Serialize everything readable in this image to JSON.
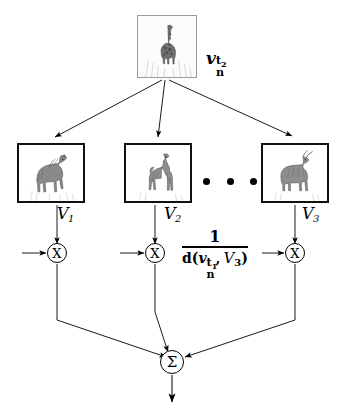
{
  "figure": {
    "type": "flow-diagram"
  },
  "query": {
    "image_alt": "giraffe",
    "label": {
      "base": "v",
      "subscript": "n",
      "superscript": "t",
      "superscript_sub": "2"
    },
    "label_text": "v_n^{t_2}"
  },
  "candidates": [
    {
      "id": "v1",
      "image_alt": "horse",
      "label_base": "V",
      "label_sub": "1",
      "label_text": "V_1"
    },
    {
      "id": "v2",
      "image_alt": "camel",
      "label_base": "V",
      "label_sub": "2",
      "label_text": "V_2"
    },
    {
      "id": "v3",
      "image_alt": "antelope",
      "label_base": "V",
      "label_sub": "3",
      "label_text": "V_3"
    }
  ],
  "ellipsis": {
    "dots": 3,
    "text": "..."
  },
  "operators": {
    "multiply_symbol": "X",
    "sum_symbol": "Σ",
    "nodes": [
      {
        "id": "mul1",
        "symbol": "X"
      },
      {
        "id": "mul2",
        "symbol": "X"
      },
      {
        "id": "mul3",
        "symbol": "X"
      },
      {
        "id": "sum",
        "symbol": "Σ"
      }
    ]
  },
  "weight_formula": {
    "numerator": "1",
    "denominator_fn": "d",
    "denominator_open": "(",
    "denominator_arg1_base": "v",
    "denominator_arg1_sub": "n",
    "denominator_arg1_sup": "t",
    "denominator_arg1_sup_sub": "1",
    "denominator_separator": ",",
    "denominator_arg2_base": "V",
    "denominator_arg2_sub": "3",
    "denominator_close": ")",
    "full_text": "1 / d(v_n^{t_1} , V_3)"
  },
  "colors": {
    "stroke": "#000000",
    "box_border": "#111111",
    "query_box_border": "#9a9a9a",
    "background": "#ffffff"
  }
}
